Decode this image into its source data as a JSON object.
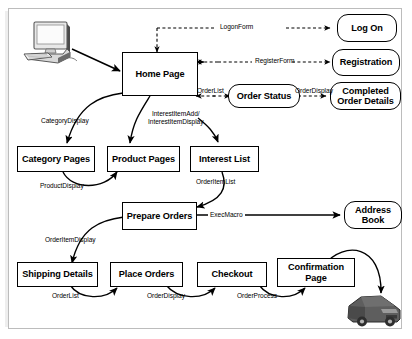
{
  "diagram": {
    "frame_color": "#bcbcbc",
    "node_border_color": "#000000",
    "background_color": "#ffffff",
    "nodes": [
      {
        "id": "home_page",
        "label": "Home Page",
        "shape": "rect"
      },
      {
        "id": "category_pages",
        "label": "Category Pages",
        "shape": "rect"
      },
      {
        "id": "product_pages",
        "label": "Product Pages",
        "shape": "rect"
      },
      {
        "id": "interest_list",
        "label": "Interest List",
        "shape": "rect"
      },
      {
        "id": "prepare_orders",
        "label": "Prepare Orders",
        "shape": "rect"
      },
      {
        "id": "shipping_details",
        "label": "Shipping Details",
        "shape": "rect"
      },
      {
        "id": "place_orders",
        "label": "Place Orders",
        "shape": "rect"
      },
      {
        "id": "checkout",
        "label": "Checkout",
        "shape": "rect"
      },
      {
        "id": "confirmation_page",
        "label": "Confirmation\nPage",
        "shape": "rect"
      },
      {
        "id": "order_status",
        "label": "Order Status",
        "shape": "rounded"
      },
      {
        "id": "log_on",
        "label": "Log On",
        "shape": "rounded"
      },
      {
        "id": "registration",
        "label": "Registration",
        "shape": "rounded"
      },
      {
        "id": "completed_order",
        "label": "Completed\nOrder Details",
        "shape": "rounded"
      },
      {
        "id": "address_book",
        "label": "Address\nBook",
        "shape": "rounded"
      }
    ],
    "edge_labels": [
      {
        "id": "logon_form",
        "text": "LogonForm"
      },
      {
        "id": "register_form",
        "text": "RegisterForm"
      },
      {
        "id": "order_list_top",
        "text": "OrderList"
      },
      {
        "id": "order_display_top",
        "text": "OrderDisplay"
      },
      {
        "id": "category_display",
        "text": "CategoryDisplay"
      },
      {
        "id": "interest_item",
        "text": "InterestItemAdd/\nInterestItemDisplay"
      },
      {
        "id": "product_display",
        "text": "ProductDisplay"
      },
      {
        "id": "order_item_list",
        "text": "OrderItemList"
      },
      {
        "id": "exec_macro",
        "text": "ExecMacro"
      },
      {
        "id": "order_item_display",
        "text": "OrderItemDisplay"
      },
      {
        "id": "order_list_bottom",
        "text": "OrderList"
      },
      {
        "id": "order_display_bottom",
        "text": "OrderDisplay"
      },
      {
        "id": "order_process",
        "text": "OrderProcess"
      }
    ],
    "icons": [
      {
        "id": "desktop_computer",
        "name": "desktop-computer-icon"
      },
      {
        "id": "delivery_truck",
        "name": "delivery-truck-icon"
      }
    ]
  }
}
